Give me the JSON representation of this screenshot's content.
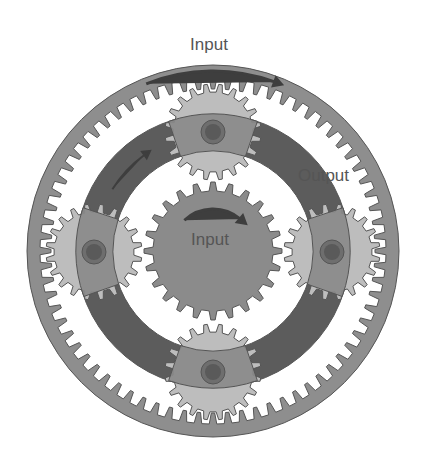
{
  "diagram": {
    "center": [
      213,
      251
    ],
    "colors": {
      "background": "#ffffff",
      "ring": "#8e8e8e",
      "carrier_dark": "#5c5c5c",
      "carrier_arm": "#8a8a8a",
      "planet": "#bdbdbd",
      "sun": "#8b8b8b",
      "pin_outer": "#6e6e6e",
      "pin_inner": "#5a5a5a",
      "stroke": "#555555",
      "arrow": "#3e3e3e",
      "label": "#555555"
    },
    "ring_gear": {
      "outer_radius": 186,
      "tip_radius": 162,
      "root_radius": 173,
      "teeth": 72
    },
    "carrier": {
      "outer_radius": 137,
      "inner_radius": 100
    },
    "sun_gear": {
      "tip_radius": 69,
      "root_radius": 60,
      "teeth": 24
    },
    "planets": [
      {
        "name": "top",
        "cx": 213,
        "cy": 132
      },
      {
        "name": "left",
        "cx": 94,
        "cy": 252
      },
      {
        "name": "right",
        "cx": 332,
        "cy": 252
      },
      {
        "name": "bottom",
        "cx": 213,
        "cy": 372
      }
    ],
    "planet_gear": {
      "tip_radius": 48,
      "root_radius": 40,
      "teeth": 20,
      "pin_radius": 12,
      "pin_inner_radius": 8
    },
    "labels": {
      "ring_input": {
        "text": "Input",
        "x": 209,
        "y": 50,
        "size": 17
      },
      "sun_input": {
        "text": "Input",
        "x": 210,
        "y": 245,
        "size": 17
      },
      "carrier_output": {
        "text": "Output",
        "x": 298,
        "y": 181,
        "size": 17
      }
    }
  }
}
